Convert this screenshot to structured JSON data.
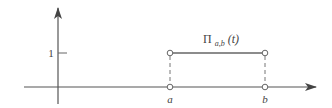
{
  "diagram": {
    "function_label": {
      "symbol": "Π",
      "subscript": "a,b",
      "argument": "(t)"
    },
    "y_tick_label": "1",
    "x_labels": {
      "a": "a",
      "b": "b"
    },
    "colors": {
      "axis": "#555555",
      "pulse": "#666666",
      "dashed": "#777777",
      "text": "#444444",
      "background": "#ffffff"
    }
  }
}
